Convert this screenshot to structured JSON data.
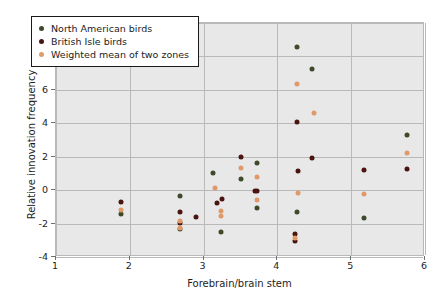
{
  "chart_data": {
    "type": "scatter",
    "title": "",
    "xlabel": "Forebrain/brain stem",
    "ylabel": "Relative innovation frequency",
    "xlim": [
      1,
      6
    ],
    "ylim": [
      -4,
      10
    ],
    "xticks": [
      1,
      2,
      3,
      4,
      5,
      6
    ],
    "yticks": [
      -4,
      -2,
      0,
      2,
      4,
      6,
      8,
      10
    ],
    "grid": true,
    "legend_position": "top-left",
    "colors": {
      "north_american": "#3f4a2b",
      "british_isle": "#4a1410",
      "weighted_mean": "#e09a6a"
    },
    "series": [
      {
        "name": "North American birds",
        "key": "na",
        "color": "#3f4a2b",
        "points": [
          [
            1.88,
            -1.45
          ],
          [
            2.68,
            -0.35
          ],
          [
            2.68,
            -2.35
          ],
          [
            3.13,
            1.02
          ],
          [
            3.23,
            -2.48
          ],
          [
            3.5,
            0.67
          ],
          [
            3.72,
            1.6
          ],
          [
            3.72,
            -1.07
          ],
          [
            4.26,
            -1.3
          ],
          [
            4.26,
            8.55
          ],
          [
            4.47,
            7.25
          ],
          [
            5.18,
            -1.65
          ],
          [
            5.76,
            3.28
          ]
        ]
      },
      {
        "name": "British Isle birds",
        "key": "bi",
        "color": "#4a1410",
        "points": [
          [
            1.88,
            -0.72
          ],
          [
            2.68,
            -1.28
          ],
          [
            2.68,
            -1.95
          ],
          [
            2.9,
            -1.62
          ],
          [
            3.18,
            -0.78
          ],
          [
            3.25,
            -0.52
          ],
          [
            3.5,
            2.0
          ],
          [
            3.69,
            -0.08
          ],
          [
            3.72,
            -0.08
          ],
          [
            4.24,
            -2.62
          ],
          [
            4.24,
            -3.05
          ],
          [
            4.26,
            4.05
          ],
          [
            4.28,
            1.12
          ],
          [
            4.47,
            1.95
          ],
          [
            5.18,
            1.22
          ],
          [
            5.76,
            1.25
          ]
        ]
      },
      {
        "name": "Weighted mean of two zones",
        "key": "wm",
        "color": "#e09a6a",
        "points": [
          [
            1.88,
            -1.2
          ],
          [
            2.68,
            -1.85
          ],
          [
            2.68,
            -2.25
          ],
          [
            3.15,
            0.12
          ],
          [
            3.23,
            -1.22
          ],
          [
            3.23,
            -1.55
          ],
          [
            3.5,
            1.35
          ],
          [
            3.72,
            0.78
          ],
          [
            3.72,
            -0.6
          ],
          [
            4.24,
            -2.88
          ],
          [
            4.26,
            6.38
          ],
          [
            4.28,
            -0.18
          ],
          [
            4.5,
            4.6
          ],
          [
            5.18,
            -0.25
          ],
          [
            5.76,
            2.25
          ]
        ]
      }
    ]
  },
  "legend": {
    "entries": [
      {
        "label": "North American birds",
        "key": "na"
      },
      {
        "label": "British Isle birds",
        "key": "bi"
      },
      {
        "label": "Weighted mean of two zones",
        "key": "wm"
      }
    ]
  },
  "axes": {
    "x_title": "Forebrain/brain stem",
    "y_title": "Relative innovation frequency",
    "x_tick_labels": [
      "1",
      "2",
      "3",
      "4",
      "5",
      "6"
    ],
    "y_tick_labels": [
      "-4",
      "-2",
      "0",
      "2",
      "4",
      "6",
      "8",
      "10"
    ]
  }
}
